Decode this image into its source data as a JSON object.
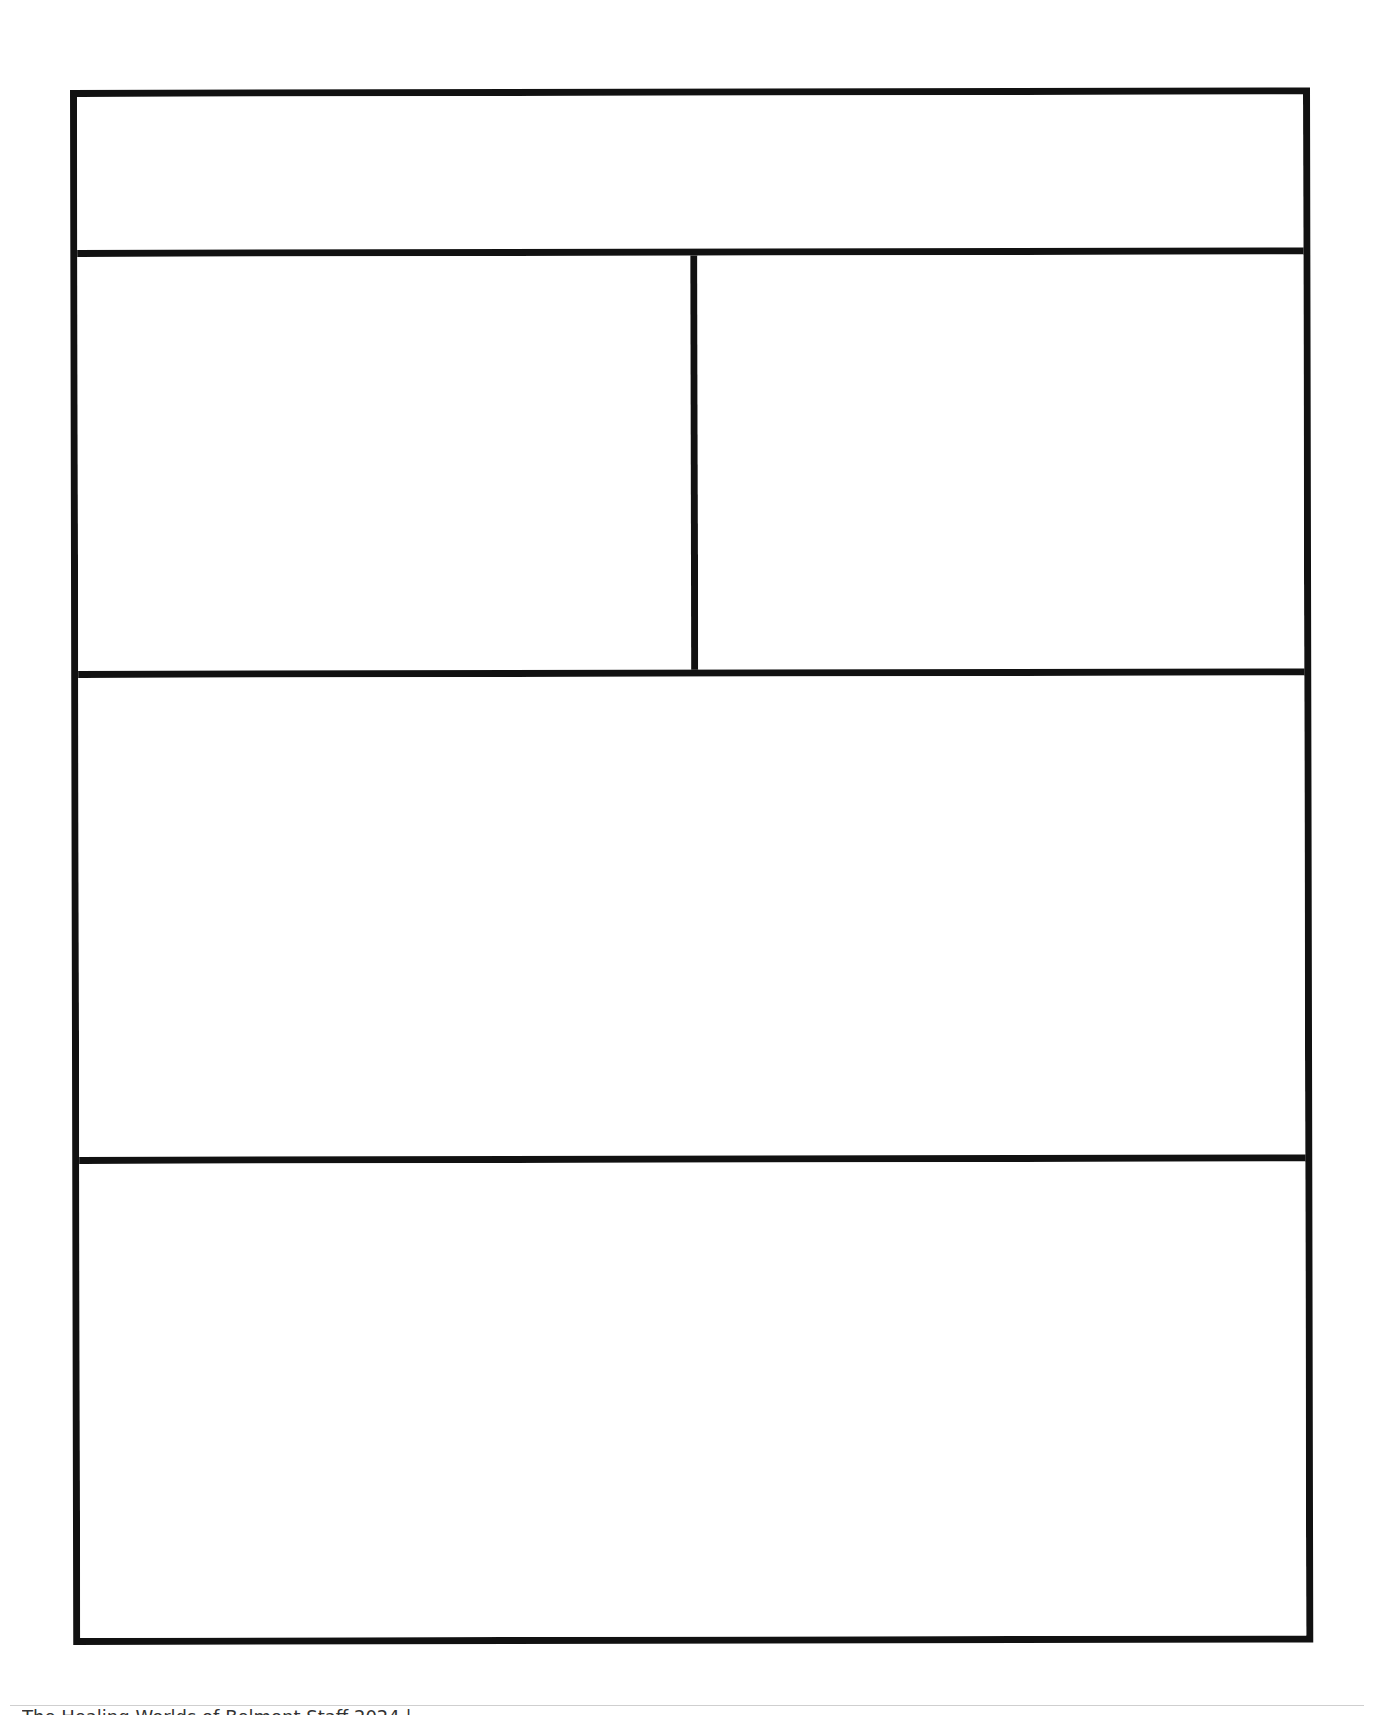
{
  "template": {
    "type": "blank panel layout",
    "panels": [
      {
        "id": "header-panel",
        "label": ""
      },
      {
        "id": "left-panel",
        "label": ""
      },
      {
        "id": "right-panel",
        "label": ""
      },
      {
        "id": "middle-panel",
        "label": ""
      },
      {
        "id": "bottom-panel",
        "label": ""
      }
    ],
    "border_color": "#111111",
    "background_color": "#ffffff"
  },
  "footer": {
    "text": "The Healing Worlds of Belmont Staff 2024 |"
  }
}
